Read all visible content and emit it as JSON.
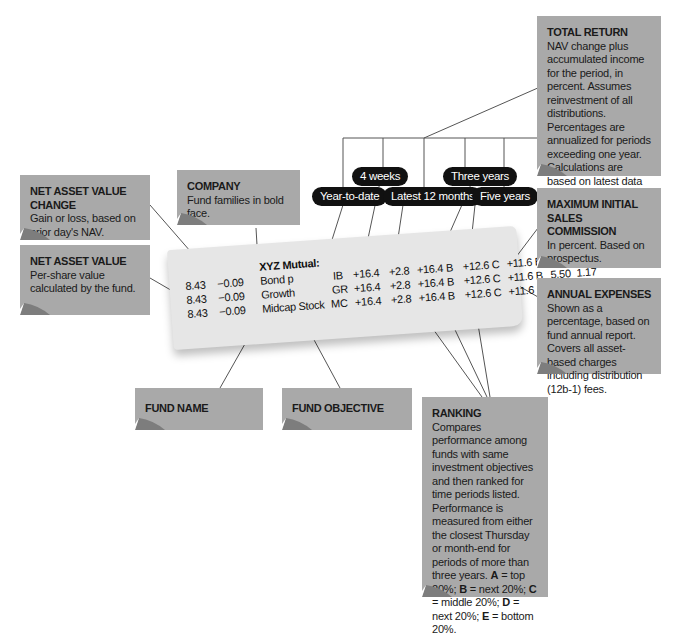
{
  "notes": {
    "total_return": {
      "title": "TOTAL RETURN",
      "body": "NAV change plus accumulated income for the period, in percent. Assumes reinvestment of all distributions. Percentages are annualized for periods exceeding one year. Calculations are based on latest data from fund."
    },
    "nav_change": {
      "title": "NET ASSET VALUE CHANGE",
      "body": "Gain or loss, based on prior day's NAV."
    },
    "company": {
      "title": "COMPANY",
      "body": "Fund families in bold face."
    },
    "nav": {
      "title": "NET ASSET  VALUE",
      "body": "Per-share value calculated by the fund."
    },
    "max_sales": {
      "title": "MAXIMUM INITIAL SALES COMMISSION",
      "body": "In percent. Based on prospectus."
    },
    "annual_expenses": {
      "title": "ANNUAL EXPENSES",
      "body": "Shown as a percentage, based on fund annual report. Covers all asset-based charges including distribution (12b-1) fees."
    },
    "fund_name": {
      "title": "FUND NAME"
    },
    "fund_objective": {
      "title": "FUND OBJECTIVE"
    },
    "ranking": {
      "title": "RANKING",
      "body_parts": [
        "Compares performance among funds with same investment objectives and then ranked for time periods listed. Performance is measured from either the closest Thursday or month-end for periods of more than three years. ",
        "A",
        " = top 20%; ",
        "B",
        " = next 20%; ",
        "C",
        " = middle 20%; ",
        "D",
        " = next 20%; ",
        "E",
        " = bottom 20%."
      ]
    }
  },
  "periods": {
    "four_weeks": "4 weeks",
    "three_years": "Three years",
    "year_to_date": "Year-to-date",
    "latest_12": "Latest 12 months",
    "five_years": "Five years"
  },
  "listing": {
    "company": "XYZ Mutual:",
    "rows": [
      {
        "nav": "8.43",
        "chg": "−0.09",
        "name": "Bond p",
        "obj": "IB",
        "ytd": "+16.4",
        "wk4": "+2.8",
        "m12": "+16.4 B",
        "y3": "+12.6 C",
        "y5": "+11.6 B",
        "sales": "5.50",
        "exp": "1.17"
      },
      {
        "nav": "8.43",
        "chg": "−0.09",
        "name": "Growth",
        "obj": "GR",
        "ytd": "+16.4",
        "wk4": "+2.8",
        "m12": "+16.4 B",
        "y3": "+12.6 C",
        "y5": "+11.6 B",
        "sales": "5.50",
        "exp": "1.17"
      },
      {
        "nav": "8.43",
        "chg": "−0.09",
        "name": "Midcap Stock",
        "obj": "MC",
        "ytd": "+16.4",
        "wk4": "+2.8",
        "m12": "+16.4 B",
        "y3": "+12.6 C",
        "y5": "+11.6 B",
        "sales": "5.50",
        "exp": "1.17"
      }
    ]
  },
  "colors": {
    "note_bg": "#a9a9a9",
    "pill_bg": "#111111",
    "paper": "#e4e4e4"
  }
}
